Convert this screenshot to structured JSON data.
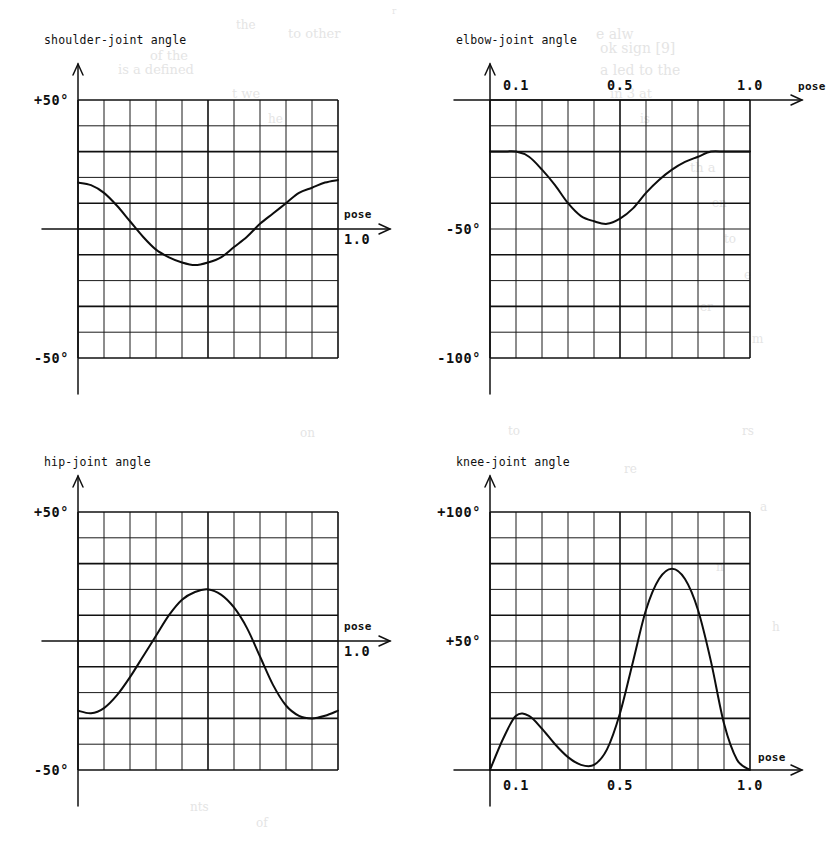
{
  "page": {
    "background_color": "#ffffff",
    "ink_color": "#101010",
    "bleed_texts": [
      {
        "text": "r",
        "x": 392,
        "y": 6,
        "size": 9
      },
      {
        "text": "to other",
        "x": 288,
        "y": 26,
        "size": 13
      },
      {
        "text": "e alw",
        "x": 596,
        "y": 26,
        "size": 14
      },
      {
        "text": "of the",
        "x": 150,
        "y": 48,
        "size": 13
      },
      {
        "text": "ok sign [9]",
        "x": 600,
        "y": 40,
        "size": 14
      },
      {
        "text": "the",
        "x": 236,
        "y": 18,
        "size": 12
      },
      {
        "text": "is a defined",
        "x": 118,
        "y": 62,
        "size": 13
      },
      {
        "text": "a led to the",
        "x": 600,
        "y": 62,
        "size": 14
      },
      {
        "text": "t we",
        "x": 232,
        "y": 86,
        "size": 13
      },
      {
        "text": "in 3 at",
        "x": 610,
        "y": 86,
        "size": 13
      },
      {
        "text": "he",
        "x": 268,
        "y": 112,
        "size": 12
      },
      {
        "text": "is",
        "x": 640,
        "y": 112,
        "size": 12
      },
      {
        "text": "th a",
        "x": 690,
        "y": 160,
        "size": 13
      },
      {
        "text": "en",
        "x": 712,
        "y": 196,
        "size": 12
      },
      {
        "text": "to",
        "x": 724,
        "y": 232,
        "size": 12
      },
      {
        "text": "e",
        "x": 744,
        "y": 268,
        "size": 12
      },
      {
        "text": "er",
        "x": 700,
        "y": 300,
        "size": 12
      },
      {
        "text": "m",
        "x": 752,
        "y": 332,
        "size": 12
      },
      {
        "text": "on",
        "x": 300,
        "y": 426,
        "size": 12
      },
      {
        "text": "to",
        "x": 508,
        "y": 424,
        "size": 12
      },
      {
        "text": "rs",
        "x": 742,
        "y": 424,
        "size": 12
      },
      {
        "text": "re",
        "x": 624,
        "y": 462,
        "size": 12
      },
      {
        "text": "a",
        "x": 760,
        "y": 500,
        "size": 12
      },
      {
        "text": "n",
        "x": 716,
        "y": 560,
        "size": 12
      },
      {
        "text": "h",
        "x": 772,
        "y": 620,
        "size": 12
      },
      {
        "text": "nts",
        "x": 190,
        "y": 800,
        "size": 12
      },
      {
        "text": "of",
        "x": 256,
        "y": 816,
        "size": 12
      }
    ]
  },
  "charts": [
    {
      "id": "shoulder",
      "title": "shoulder-joint angle",
      "y_axis_labels": [
        {
          "text": "+50°",
          "value": 50
        },
        {
          "text": "-50°",
          "value": -50
        }
      ],
      "x_axis_labels": [
        {
          "text": "1.0",
          "value": 1.0
        }
      ],
      "x_axis_name": "pose",
      "has_axis_arrow_x": true,
      "has_axis_arrow_y": true,
      "baseline_label": "0"
    },
    {
      "id": "elbow",
      "title": "elbow-joint angle",
      "y_axis_labels": [
        {
          "text": "-50°",
          "value": -50
        },
        {
          "text": "-100°",
          "value": -100
        }
      ],
      "x_axis_labels": [
        {
          "text": "0.1",
          "value": 0.1
        },
        {
          "text": "0.5",
          "value": 0.5
        },
        {
          "text": "1.0",
          "value": 1.0
        }
      ],
      "x_axis_name": "pose",
      "has_axis_arrow_x": true,
      "has_axis_arrow_y": true,
      "baseline_label": "0"
    },
    {
      "id": "hip",
      "title": "hip-joint angle",
      "y_axis_labels": [
        {
          "text": "+50°",
          "value": 50
        },
        {
          "text": "-50°",
          "value": -50
        }
      ],
      "x_axis_labels": [
        {
          "text": "1.0",
          "value": 1.0
        }
      ],
      "x_axis_name": "pose",
      "has_axis_arrow_x": true,
      "has_axis_arrow_y": true,
      "baseline_label": "0"
    },
    {
      "id": "knee",
      "title": "knee-joint angle",
      "y_axis_labels": [
        {
          "text": "+100°",
          "value": 100
        },
        {
          "text": "+50°",
          "value": 50
        }
      ],
      "x_axis_labels": [
        {
          "text": "0.1",
          "value": 0.1
        },
        {
          "text": "0.5",
          "value": 0.5
        },
        {
          "text": "1.0",
          "value": 1.0
        }
      ],
      "x_axis_name": "pose",
      "has_axis_arrow_x": true,
      "has_axis_arrow_y": true,
      "baseline_label": "0"
    }
  ],
  "chart_data": [
    {
      "type": "line",
      "id": "shoulder",
      "title": "shoulder-joint angle",
      "xlabel": "pose",
      "ylabel": "shoulder-joint angle",
      "xlim": [
        0.0,
        1.0
      ],
      "ylim": [
        -50,
        50
      ],
      "grid": true,
      "grid_cols": 10,
      "grid_rows": 10,
      "xticks": [
        1.0
      ],
      "xticklabels": [
        "1.0"
      ],
      "yticks": [
        50,
        -50
      ],
      "yticklabels": [
        "+50°",
        "-50°"
      ],
      "legend": null,
      "x": [
        0.0,
        0.05,
        0.1,
        0.15,
        0.2,
        0.25,
        0.3,
        0.35,
        0.4,
        0.45,
        0.5,
        0.55,
        0.6,
        0.65,
        0.7,
        0.75,
        0.8,
        0.85,
        0.9,
        0.95,
        1.0
      ],
      "y": [
        18,
        17,
        14,
        9,
        3,
        -3,
        -8,
        -11,
        -13,
        -14,
        -13,
        -11,
        -7,
        -3,
        2,
        6,
        10,
        14,
        16,
        18,
        19
      ]
    },
    {
      "type": "line",
      "id": "elbow",
      "title": "elbow-joint angle",
      "xlabel": "pose",
      "ylabel": "elbow-joint angle",
      "xlim": [
        0.0,
        1.0
      ],
      "ylim": [
        -100,
        0
      ],
      "grid": true,
      "grid_cols": 10,
      "grid_rows": 10,
      "xticks": [
        0.1,
        0.5,
        1.0
      ],
      "xticklabels": [
        "0.1",
        "0.5",
        "1.0"
      ],
      "yticks": [
        -50,
        -100
      ],
      "yticklabels": [
        "-50°",
        "-100°"
      ],
      "legend": null,
      "x": [
        0.0,
        0.05,
        0.1,
        0.15,
        0.2,
        0.25,
        0.3,
        0.35,
        0.4,
        0.45,
        0.5,
        0.55,
        0.6,
        0.65,
        0.7,
        0.75,
        0.8,
        0.85,
        0.9,
        0.95,
        1.0
      ],
      "y": [
        -20,
        -20,
        -20,
        -22,
        -27,
        -33,
        -40,
        -45,
        -47,
        -48,
        -46,
        -42,
        -36,
        -31,
        -27,
        -24,
        -22,
        -20,
        -20,
        -20,
        -20
      ]
    },
    {
      "type": "line",
      "id": "hip",
      "title": "hip-joint angle",
      "xlabel": "pose",
      "ylabel": "hip-joint angle",
      "xlim": [
        0.0,
        1.0
      ],
      "ylim": [
        -50,
        50
      ],
      "grid": true,
      "grid_cols": 10,
      "grid_rows": 10,
      "xticks": [
        1.0
      ],
      "xticklabels": [
        "1.0"
      ],
      "yticks": [
        50,
        -50
      ],
      "yticklabels": [
        "+50°",
        "-50°"
      ],
      "legend": null,
      "x": [
        0.0,
        0.05,
        0.1,
        0.15,
        0.2,
        0.25,
        0.3,
        0.35,
        0.4,
        0.45,
        0.5,
        0.55,
        0.6,
        0.65,
        0.7,
        0.75,
        0.8,
        0.85,
        0.9,
        0.95,
        1.0
      ],
      "y": [
        -27,
        -28,
        -26,
        -21,
        -14,
        -6,
        2,
        10,
        16,
        19,
        20,
        18,
        13,
        5,
        -6,
        -17,
        -25,
        -29,
        -30,
        -29,
        -27
      ]
    },
    {
      "type": "line",
      "id": "knee",
      "title": "knee-joint angle",
      "xlabel": "pose",
      "ylabel": "knee-joint angle",
      "xlim": [
        0.0,
        1.0
      ],
      "ylim": [
        0,
        100
      ],
      "grid": true,
      "grid_cols": 10,
      "grid_rows": 10,
      "xticks": [
        0.1,
        0.5,
        1.0
      ],
      "xticklabels": [
        "0.1",
        "0.5",
        "1.0"
      ],
      "yticks": [
        100,
        50
      ],
      "yticklabels": [
        "+100°",
        "+50°"
      ],
      "legend": null,
      "x": [
        0.0,
        0.05,
        0.1,
        0.15,
        0.2,
        0.25,
        0.3,
        0.35,
        0.4,
        0.45,
        0.5,
        0.55,
        0.6,
        0.65,
        0.7,
        0.75,
        0.8,
        0.85,
        0.9,
        0.95,
        1.0
      ],
      "y": [
        0,
        12,
        21,
        21,
        16,
        10,
        5,
        2,
        2,
        8,
        22,
        42,
        62,
        74,
        78,
        74,
        62,
        42,
        18,
        4,
        0
      ]
    }
  ]
}
